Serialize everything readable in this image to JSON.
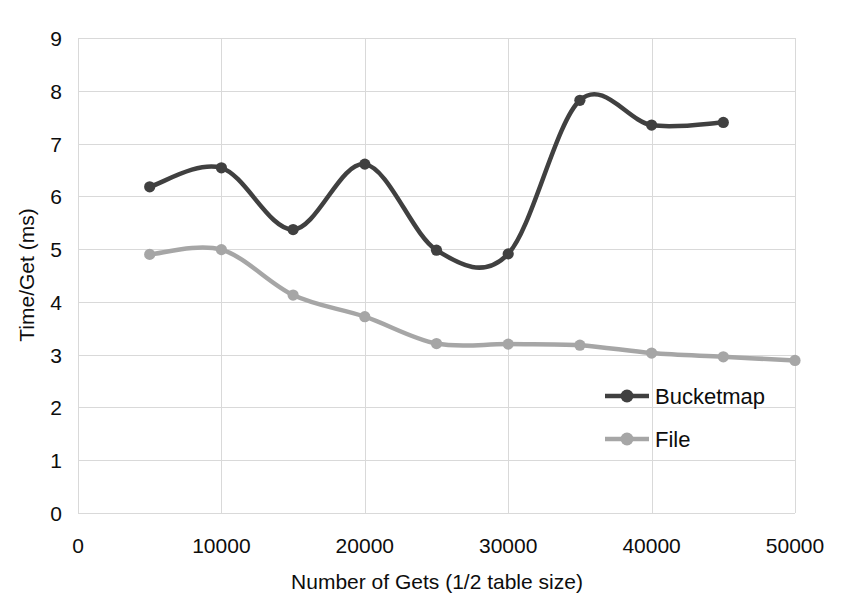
{
  "chart_data": {
    "type": "line",
    "title": "",
    "xlabel": "Number of Gets (1/2 table size)",
    "ylabel": "Time/Get (ms)",
    "xlim": [
      0,
      50000
    ],
    "ylim": [
      0,
      9
    ],
    "xticks": [
      "0",
      "10000",
      "20000",
      "30000",
      "40000",
      "50000"
    ],
    "xtick_values": [
      0,
      10000,
      20000,
      30000,
      40000,
      50000
    ],
    "yticks": [
      "0",
      "1",
      "2",
      "3",
      "4",
      "5",
      "6",
      "7",
      "8",
      "9"
    ],
    "ytick_values": [
      0,
      1,
      2,
      3,
      4,
      5,
      6,
      7,
      8,
      9
    ],
    "grid": true,
    "smoothing": "spline",
    "legend_position": "inside-lower-right",
    "x": [
      5000,
      10000,
      15000,
      20000,
      25000,
      30000,
      35000,
      40000,
      45000,
      50000
    ],
    "series": [
      {
        "name": "Bucketmap",
        "color": "#404040",
        "x": [
          5000,
          10000,
          15000,
          20000,
          25000,
          30000,
          35000,
          40000,
          45000
        ],
        "values": [
          6.18,
          6.54,
          5.37,
          6.61,
          4.98,
          4.91,
          7.82,
          7.35,
          7.4
        ]
      },
      {
        "name": "File",
        "color": "#a6a6a6",
        "x": [
          5000,
          10000,
          15000,
          20000,
          25000,
          30000,
          35000,
          40000,
          45000,
          50000
        ],
        "values": [
          4.9,
          4.99,
          4.13,
          3.72,
          3.21,
          3.2,
          3.18,
          3.03,
          2.96,
          2.89
        ]
      }
    ]
  },
  "legend": {
    "items": [
      {
        "label": "Bucketmap",
        "color": "#404040"
      },
      {
        "label": "File",
        "color": "#a6a6a6"
      }
    ]
  }
}
